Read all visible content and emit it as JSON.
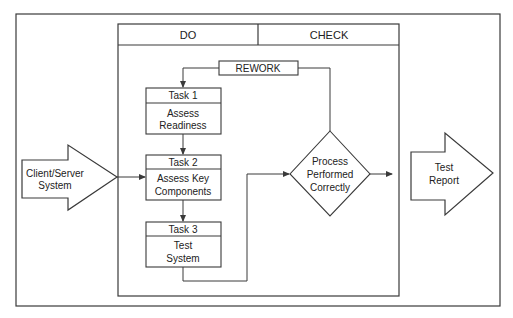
{
  "diagram": {
    "type": "workflow",
    "columns": [
      {
        "id": "do",
        "label": "DO"
      },
      {
        "id": "check",
        "label": "CHECK"
      }
    ],
    "input": {
      "line1": "Client/Server",
      "line2": "System"
    },
    "output": {
      "line1": "Test",
      "line2": "Report"
    },
    "rework": {
      "label": "REWORK"
    },
    "tasks": [
      {
        "title": "Task 1",
        "line1": "Assess",
        "line2": "Readiness"
      },
      {
        "title": "Task 2",
        "line1": "Assess Key",
        "line2": "Components"
      },
      {
        "title": "Task 3",
        "line1": "Test",
        "line2": "System"
      }
    ],
    "decision": {
      "line1": "Process",
      "line2": "Performed",
      "line3": "Correctly"
    },
    "colors": {
      "stroke": "#3a3a3a",
      "text": "#222222",
      "background": "#ffffff"
    }
  }
}
